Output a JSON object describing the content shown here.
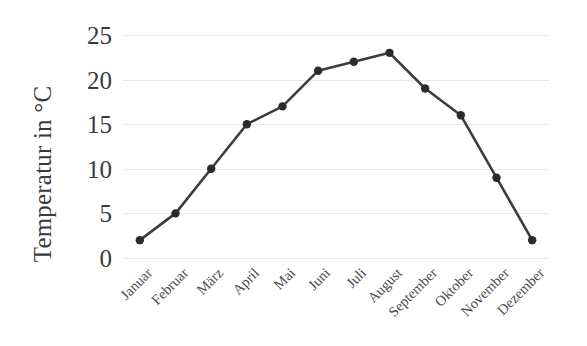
{
  "chart_data": {
    "type": "line",
    "title": "",
    "subtitle": "",
    "xlabel": "",
    "ylabel": "Temperatur in °C",
    "categories": [
      "Januar",
      "Februar",
      "März",
      "April",
      "Mai",
      "Juni",
      "Juli",
      "August",
      "September",
      "Oktober",
      "November",
      "Dezember"
    ],
    "values": [
      2,
      5,
      10,
      15,
      17,
      21,
      22,
      23,
      19,
      16,
      9,
      2
    ],
    "series": [
      {
        "name": "Temperatur",
        "values": [
          2,
          5,
          10,
          15,
          17,
          21,
          22,
          23,
          19,
          16,
          9,
          2
        ]
      }
    ],
    "ylim": [
      0,
      25
    ],
    "yticks": [
      0,
      5,
      10,
      15,
      20,
      25
    ],
    "ytick_labels": [
      "0",
      "5",
      "10",
      "15",
      "20",
      "25"
    ],
    "grid": "horizontal",
    "legend": "none",
    "annotations": [],
    "style": {
      "line_color": "#3d3d3d",
      "marker_color": "#2b2b2b",
      "gridline_color": "#e9e9e9",
      "background": "#ffffff",
      "text_color": "#3a3a3a",
      "line_width": 2.6,
      "marker_radius": 4.2,
      "marker_shape": "circle"
    }
  }
}
